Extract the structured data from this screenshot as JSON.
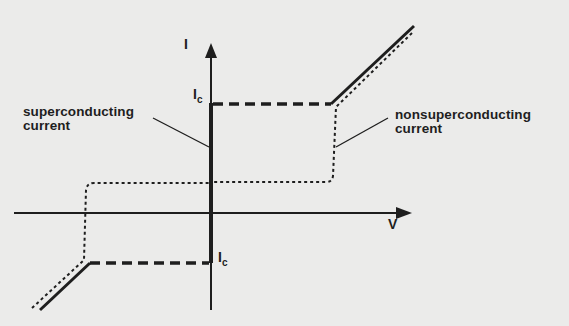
{
  "diagram": {
    "axes": {
      "y_label": "I",
      "x_label": "V"
    },
    "critical_current": {
      "symbol": "I",
      "subscript": "c"
    },
    "annotations": {
      "superconducting": [
        "superconducting",
        "current"
      ],
      "nonsuperconducting": [
        "nonsuperconducting",
        "current"
      ]
    },
    "colors": {
      "ink": "#1e1e1e",
      "background": "#ebebea"
    }
  }
}
